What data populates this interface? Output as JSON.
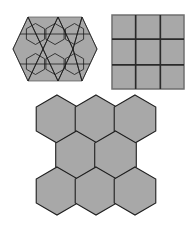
{
  "page": {
    "background_color": "#ffffff",
    "width": 191,
    "height": 235,
    "figure_count": 3,
    "caption": ""
  },
  "style": {
    "fill_gray": "#a8a8a8",
    "fill_gray_light": "#b0b0b0",
    "stroke_dark": "#1a1a1a",
    "stroke_medium": "#3c3c3c",
    "stroke_outline": "#555555",
    "stroke_width_thin": 0.7,
    "stroke_width_medium": 1.1,
    "stroke_width_thick": 1.5
  },
  "figures": [
    {
      "id": "tessellation",
      "name": "triangle-hexagon-tessellation",
      "label": "Figure 1",
      "description": "Hexagonal band overlaid with triangles, hexagons and horizontal lines",
      "shape_outline": "elongated hexagon / double trapezoid",
      "element_counts": {
        "triangles": 12,
        "hexagons": 6,
        "horizontal_lines": 2
      },
      "fill": "#a8a8a8",
      "stroke": "#1a1a1a",
      "viewbox": "0 0 180 140",
      "outline_points": "6,70 36,6 144,6 174,70 144,134 36,134",
      "zigzag_top": [
        "6,70 36,6 66,70",
        "36,6 66,70 96,6",
        "66,70 96,6 126,70",
        "96,6 126,70 144,6",
        "126,70 144,6 174,70"
      ],
      "zigzag_bottom": [
        "6,70 36,134 66,70",
        "36,134 66,70 96,134",
        "66,70 96,134 126,70",
        "96,134 126,70 144,134",
        "126,70 144,134 174,70"
      ],
      "horizontal_lines": [
        {
          "y": 40,
          "x1": 20,
          "x2": 160
        },
        {
          "y": 100,
          "x1": 20,
          "x2": 160
        }
      ],
      "inner_hexagons": [
        {
          "cx": 51,
          "cy": 40,
          "r": 21
        },
        {
          "cx": 90,
          "cy": 40,
          "r": 21
        },
        {
          "cx": 129,
          "cy": 40,
          "r": 21
        },
        {
          "cx": 51,
          "cy": 100,
          "r": 21
        },
        {
          "cx": 90,
          "cy": 100,
          "r": 21
        },
        {
          "cx": 129,
          "cy": 100,
          "r": 21
        }
      ]
    },
    {
      "id": "grid",
      "name": "three-by-three-square-grid",
      "label": "Figure 2",
      "description": "Square tiling, three columns by three rows",
      "rows": 3,
      "columns": 3,
      "cell_count": 9,
      "fill": "#a8a8a8",
      "stroke": "#2a2a2a",
      "border_stroke": "#6e6e6e",
      "viewbox": "0 0 150 154",
      "size": {
        "width": 150,
        "height": 154
      },
      "vertical_line_x": [
        50,
        100
      ],
      "horizontal_line_y": [
        51,
        103
      ]
    },
    {
      "id": "hexagons",
      "name": "hexagon-tessellation",
      "label": "Figure 3",
      "description": "Eight pointy-top hexagons in three rows: 3 top, 2 middle, 3 bottom",
      "hexagon_count": 8,
      "rows": [
        {
          "row": "top",
          "count": 3
        },
        {
          "row": "middle",
          "count": 2
        },
        {
          "row": "bottom",
          "count": 3
        }
      ],
      "orientation": "pointy-top",
      "fill": "#a8a8a8",
      "stroke": "#1f1f1f",
      "viewbox": "0 0 280 268",
      "radius": 48,
      "centers": [
        {
          "cx": 62,
          "cy": 50,
          "row": "top",
          "index": 0
        },
        {
          "cx": 140,
          "cy": 50,
          "row": "top",
          "index": 1
        },
        {
          "cx": 218,
          "cy": 50,
          "row": "top",
          "index": 2
        },
        {
          "cx": 101,
          "cy": 122,
          "row": "middle",
          "index": 0
        },
        {
          "cx": 179,
          "cy": 122,
          "row": "middle",
          "index": 1
        },
        {
          "cx": 62,
          "cy": 194,
          "row": "bottom",
          "index": 0
        },
        {
          "cx": 140,
          "cy": 194,
          "row": "bottom",
          "index": 1
        },
        {
          "cx": 218,
          "cy": 194,
          "row": "bottom",
          "index": 2
        }
      ]
    }
  ]
}
